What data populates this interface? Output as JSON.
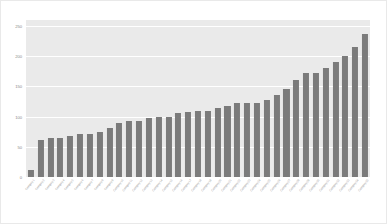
{
  "figure": {
    "background_color": "#ffffff",
    "plot_background_color": "#eaeaea",
    "gridline_color": "#ffffff",
    "bar_color": "#7b7b7b",
    "tick_label_color": "#8c8c8c",
    "xlabel_color": "#a2a2a2"
  },
  "chart_data": {
    "type": "bar",
    "title": "",
    "subtitle": "",
    "xlabel": "",
    "ylabel": "",
    "ylim": [
      0,
      260
    ],
    "yticks": [
      0,
      50,
      100,
      150,
      200,
      250
    ],
    "ytick_labels": [
      "0",
      "50",
      "100",
      "150",
      "200",
      "250"
    ],
    "grid": true,
    "grid_axis": "y",
    "legend": false,
    "legend_position": "none",
    "orientation": "vertical",
    "sorted": "ascending",
    "bar_count": 35,
    "categories": [
      "Category 1",
      "Category 2",
      "Category 3",
      "Category 4",
      "Category 5",
      "Category 6",
      "Category 7",
      "Category 8",
      "Category 9",
      "Category 10",
      "Category 11",
      "Category 12",
      "Category 13",
      "Category 14",
      "Category 15",
      "Category 16",
      "Category 17",
      "Category 18",
      "Category 19",
      "Category 20",
      "Category 21",
      "Category 22",
      "Category 23",
      "Category 24",
      "Category 25",
      "Category 26",
      "Category 27",
      "Category 28",
      "Category 29",
      "Category 30",
      "Category 31",
      "Category 32",
      "Category 33",
      "Category 34",
      "Category 35"
    ],
    "xtick_labels_legible": false,
    "xtick_label_rotation": -52,
    "values": [
      12,
      62,
      64,
      65,
      68,
      72,
      72,
      75,
      82,
      89,
      93,
      93,
      97,
      100,
      100,
      106,
      108,
      110,
      110,
      114,
      118,
      122,
      122,
      122,
      127,
      136,
      145,
      160,
      172,
      172,
      180,
      190,
      201,
      215,
      237
    ]
  }
}
